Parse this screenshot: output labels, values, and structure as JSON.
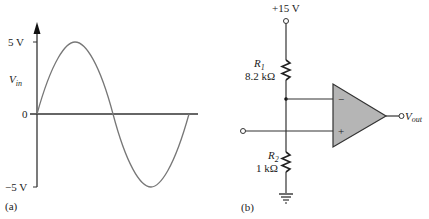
{
  "panel_a": {
    "label": "(a)",
    "y_axis_label": "V",
    "y_axis_label_sub": "in",
    "ticks": [
      {
        "label": "5 V",
        "value": 5
      },
      {
        "label": "0",
        "value": 0
      },
      {
        "label": "−5 V",
        "value": -5
      }
    ],
    "waveform": "sine",
    "amplitude_v": 5,
    "cycles": 1
  },
  "panel_b": {
    "label": "(b)",
    "supply_label": "+15 V",
    "r1": {
      "name": "R",
      "sub": "1",
      "value": "8.2 kΩ"
    },
    "r2": {
      "name": "R",
      "sub": "2",
      "value": "1 kΩ"
    },
    "opamp": {
      "inverting_sign": "−",
      "noninverting_sign": "+",
      "fill_color": "#b5b5b5"
    },
    "output_label": "V",
    "output_label_sub": "out"
  }
}
